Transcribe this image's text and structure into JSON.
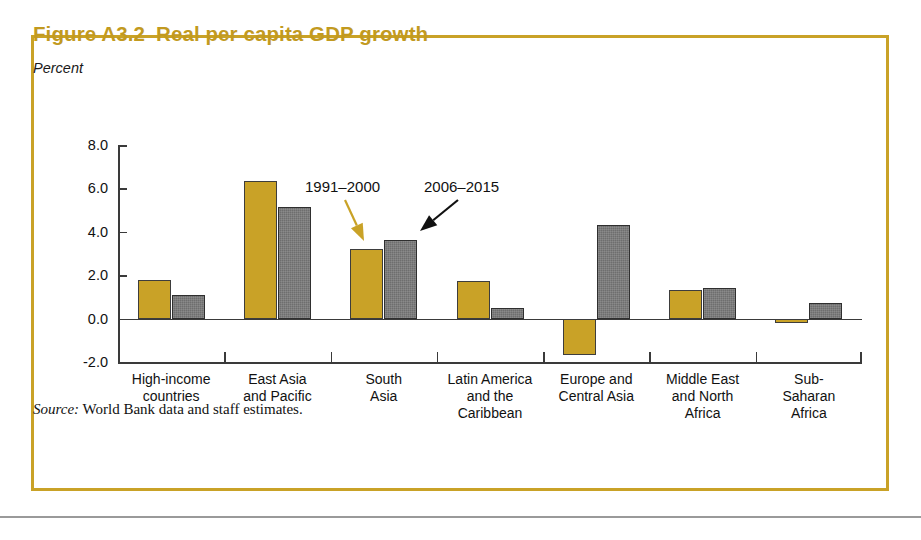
{
  "figure": {
    "number": "Figure A3.2",
    "title": "Real per capita GDP growth",
    "unit_label": "Percent",
    "source": "World Bank data and staff estimates.",
    "source_word": "Source:",
    "border_color": "#c9a227",
    "title_color": "#c29a1f"
  },
  "annotations": [
    {
      "text": "1991–2000",
      "color": "#c9a227",
      "target": "series-a"
    },
    {
      "text": "2006–2015",
      "color": "#111111",
      "target": "series-b"
    }
  ],
  "chart_data": {
    "type": "bar",
    "title": "Real per capita GDP growth",
    "xlabel": "",
    "ylabel": "Percent",
    "ylim": [
      -2.0,
      8.0
    ],
    "yticks": [
      "8.0",
      "6.0",
      "4.0",
      "2.0",
      "0.0",
      "-2.0"
    ],
    "ytick_values": [
      8.0,
      6.0,
      4.0,
      2.0,
      0.0,
      -2.0
    ],
    "grid": false,
    "legend_position": "annotated-arrows",
    "categories": [
      "High-income countries",
      "East Asia and Pacific",
      "South Asia",
      "Latin America and the Caribbean",
      "Europe and Central Asia",
      "Middle East and North Africa",
      "Sub-Saharan Africa"
    ],
    "category_lines": [
      [
        "High-income",
        "countries"
      ],
      [
        "East Asia",
        "and Pacific"
      ],
      [
        "South",
        "Asia"
      ],
      [
        "Latin America",
        "and the",
        "Caribbean"
      ],
      [
        "Europe and",
        "Central Asia"
      ],
      [
        "Middle East",
        "and North",
        "Africa"
      ],
      [
        "Sub-",
        "Saharan",
        "Africa"
      ]
    ],
    "series": [
      {
        "name": "1991–2000",
        "color": "#c9a227",
        "values": [
          1.8,
          6.35,
          3.2,
          1.75,
          -1.7,
          1.3,
          -0.15
        ]
      },
      {
        "name": "2006–2015",
        "color": "#6e6e6e",
        "values": [
          1.1,
          5.15,
          3.6,
          0.5,
          4.3,
          1.4,
          0.7
        ]
      }
    ]
  }
}
